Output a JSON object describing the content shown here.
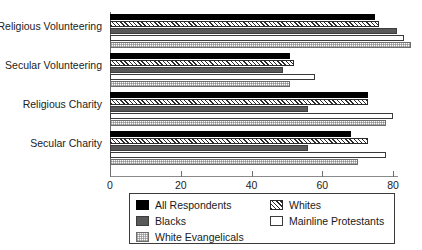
{
  "chart_data": {
    "type": "bar",
    "orientation": "horizontal",
    "title": "",
    "xlabel": "",
    "ylabel": "",
    "xlim": [
      0,
      90
    ],
    "grid": false,
    "legend_position": "bottom",
    "categories": [
      "Religious Volunteering",
      "Secular Volunteering",
      "Religious Charity",
      "Secular Charity"
    ],
    "series": [
      {
        "name": "All Respondents",
        "key": "all",
        "style": "solid-black",
        "color": "#000000",
        "values": [
          75,
          51,
          73,
          68
        ]
      },
      {
        "name": "Whites",
        "key": "whites",
        "style": "diagonal-hatch",
        "color": "#2b2b2b",
        "values": [
          76,
          52,
          73,
          73
        ]
      },
      {
        "name": "Blacks",
        "key": "blacks",
        "style": "solid-gray",
        "color": "#595959",
        "values": [
          81,
          49,
          56,
          56
        ]
      },
      {
        "name": "Mainline Protestants",
        "key": "mainline",
        "style": "solid-white",
        "color": "#ffffff",
        "values": [
          83,
          58,
          80,
          78
        ]
      },
      {
        "name": "White Evangelicals",
        "key": "whiteev",
        "style": "dotted-grid",
        "color": "#d8d8d8",
        "values": [
          85,
          51,
          78,
          70
        ]
      }
    ],
    "xticks": [
      {
        "value": 0,
        "label": "0"
      },
      {
        "value": 20,
        "label": "20"
      },
      {
        "value": 40,
        "label": "40"
      },
      {
        "value": 60,
        "label": "60"
      },
      {
        "value": 80,
        "label": "80"
      }
    ]
  },
  "legend": {
    "left_column": [
      {
        "label": "All Respondents",
        "series_key": "all"
      },
      {
        "label": "Blacks",
        "series_key": "blacks"
      },
      {
        "label": "White Evangelicals",
        "series_key": "whiteev"
      }
    ],
    "right_column": [
      {
        "label": "Whites",
        "series_key": "whites"
      },
      {
        "label": "Mainline Protestants",
        "series_key": "mainline"
      }
    ]
  }
}
